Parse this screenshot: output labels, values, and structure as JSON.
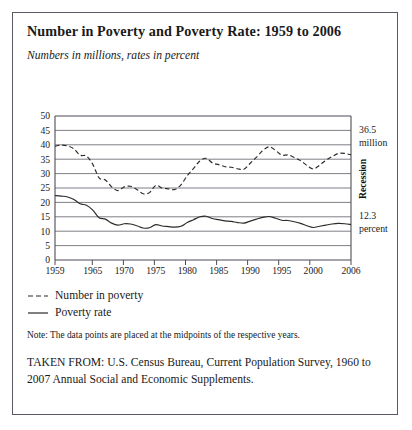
{
  "figure": {
    "title": "Number in Poverty and Poverty Rate: 1959 to 2006",
    "subtitle": "Numbers in millions, rates in percent",
    "note": "Note: The data points are placed at the midpoints of the respective years.",
    "source": "TAKEN FROM: U.S. Census Bureau, Current Population Survey, 1960 to 2007 Annual Social and Economic Supplements.",
    "border_color": "#5a5a62"
  },
  "legend": {
    "items": [
      {
        "label": "Number in poverty",
        "style": "dashed",
        "marker": "dashed-line-marker"
      },
      {
        "label": "Poverty rate",
        "style": "solid",
        "marker": "solid-line-marker"
      }
    ]
  },
  "annotations": {
    "number_value": "36.5",
    "number_unit": "million",
    "rate_value": "12.3",
    "rate_unit": "percent",
    "recession_label": "Recession"
  },
  "chart_data": {
    "type": "line",
    "title": "Number in Poverty and Poverty Rate: 1959 to 2006",
    "subtitle": "Numbers in millions, rates in percent",
    "xlabel": "",
    "ylabel": "",
    "xlim": [
      1959,
      2006
    ],
    "ylim": [
      0,
      50
    ],
    "yticks": [
      0,
      5,
      10,
      15,
      20,
      25,
      30,
      35,
      40,
      45,
      50
    ],
    "xticks": [
      1959,
      1965,
      1970,
      1975,
      1980,
      1985,
      1990,
      1995,
      2000,
      2006
    ],
    "xticklabels": [
      "1959",
      "1965",
      "1970",
      "1975",
      "1980",
      "1985",
      "1990",
      "1995",
      "2000",
      "2006"
    ],
    "yticklabels": [
      "0",
      "5",
      "10",
      "15",
      "20",
      "25",
      "30",
      "35",
      "40",
      "45",
      "50"
    ],
    "grid": "horizontal",
    "legend_position": "below-plot",
    "x": [
      1959,
      1960,
      1961,
      1962,
      1963,
      1964,
      1965,
      1966,
      1967,
      1968,
      1969,
      1970,
      1971,
      1972,
      1973,
      1974,
      1975,
      1976,
      1977,
      1978,
      1979,
      1980,
      1981,
      1982,
      1983,
      1984,
      1985,
      1986,
      1987,
      1988,
      1989,
      1990,
      1991,
      1992,
      1993,
      1994,
      1995,
      1996,
      1997,
      1998,
      1999,
      2000,
      2001,
      2002,
      2003,
      2004,
      2005,
      2006
    ],
    "series": [
      {
        "name": "Number in poverty",
        "unit": "millions",
        "style": "dashed",
        "values": [
          39.5,
          39.9,
          39.6,
          38.6,
          36.4,
          36.1,
          33.2,
          28.5,
          27.8,
          25.4,
          24.1,
          25.4,
          25.6,
          24.5,
          23.0,
          23.4,
          25.9,
          25.0,
          24.7,
          24.5,
          26.1,
          29.3,
          31.8,
          34.4,
          35.3,
          33.7,
          33.1,
          32.4,
          32.2,
          31.7,
          31.5,
          33.6,
          35.7,
          38.0,
          39.3,
          38.1,
          36.4,
          36.5,
          35.6,
          34.5,
          32.8,
          31.6,
          32.9,
          34.6,
          35.9,
          37.0,
          37.0,
          36.5
        ]
      },
      {
        "name": "Poverty rate",
        "unit": "percent",
        "style": "solid",
        "values": [
          22.4,
          22.2,
          21.9,
          21.0,
          19.5,
          19.0,
          17.3,
          14.7,
          14.2,
          12.8,
          12.1,
          12.6,
          12.5,
          11.9,
          11.1,
          11.2,
          12.3,
          11.8,
          11.6,
          11.4,
          11.7,
          13.0,
          14.0,
          15.0,
          15.2,
          14.4,
          14.0,
          13.6,
          13.4,
          13.0,
          12.8,
          13.5,
          14.2,
          14.8,
          15.1,
          14.5,
          13.8,
          13.7,
          13.3,
          12.7,
          11.9,
          11.3,
          11.7,
          12.1,
          12.5,
          12.7,
          12.6,
          12.3
        ]
      }
    ],
    "endpoint_annotations": [
      {
        "series": "Number in poverty",
        "year": 2006,
        "value": 36.5,
        "text": "36.5 million"
      },
      {
        "series": "Poverty rate",
        "year": 2006,
        "value": 12.3,
        "text": "12.3 percent"
      }
    ],
    "recession_bands_label": "Recession"
  }
}
